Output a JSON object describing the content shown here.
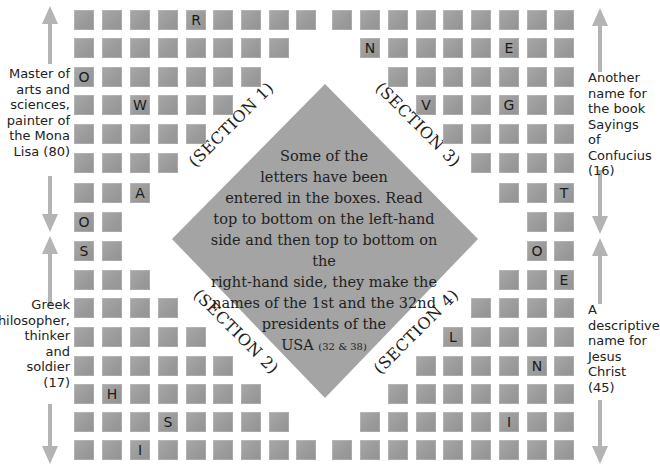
{
  "puzzle": {
    "instructions": {
      "lines": [
        "Some of the",
        "letters have been",
        "entered in the boxes. Read",
        "top to bottom on the left-hand",
        "side and then top to bottom on the",
        "right-hand side, they make the",
        "names of the 1st and the 32nd",
        "presidents of the"
      ],
      "last_line": "USA",
      "last_line_small": "(32 & 38)"
    },
    "sections": {
      "s1": "(SECTION 1)",
      "s2": "(SECTION 2)",
      "s3": "(SECTION 3)",
      "s4": "(SECTION 4)"
    },
    "clues": {
      "left_top": [
        "Master of",
        "arts and",
        "sciences,",
        "painter of",
        "the Mona",
        "Lisa (80)"
      ],
      "left_bottom": [
        "Greek",
        "philosopher,",
        "thinker",
        "and",
        "soldier",
        "(17)"
      ],
      "right_top": [
        "Another",
        "name for",
        "the book",
        "Sayings of",
        "Confucius",
        "(16)"
      ],
      "right_bottom": [
        "A",
        "descriptive",
        "name for",
        "Jesus",
        "Christ",
        "(45)"
      ]
    },
    "colors": {
      "box": "#9c9c9c",
      "diamond": "#a4a4a4",
      "arrow": "#b4b4b4",
      "text": "#222222"
    },
    "grid": {
      "left_cols_x": [
        74,
        102,
        130,
        158,
        186,
        213,
        241,
        269,
        296
      ],
      "right_cols_x": [
        332,
        360,
        388,
        416,
        443,
        471,
        499,
        527,
        554
      ],
      "rows_y": [
        10,
        38,
        67,
        95,
        124,
        153,
        183,
        212,
        241,
        270,
        298,
        327,
        356,
        384,
        412,
        440
      ],
      "left_rows": [
        {
          "cols": [
            0,
            1,
            2,
            3,
            4,
            5,
            6,
            7,
            8
          ],
          "letters": {
            "4": "R"
          }
        },
        {
          "cols": [
            0,
            1,
            2,
            3,
            4,
            5,
            6,
            7
          ],
          "letters": {}
        },
        {
          "cols": [
            0,
            1,
            2,
            3,
            4,
            5,
            6
          ],
          "letters": {
            "0": "O"
          }
        },
        {
          "cols": [
            0,
            1,
            2,
            3,
            4,
            5
          ],
          "letters": {
            "2": "W"
          }
        },
        {
          "cols": [
            0,
            1,
            2,
            3,
            4
          ],
          "letters": {}
        },
        {
          "cols": [
            0,
            1,
            2,
            3
          ],
          "letters": {}
        },
        {
          "cols": [
            0,
            1,
            2
          ],
          "letters": {
            "2": "A"
          }
        },
        {
          "cols": [
            0,
            1
          ],
          "letters": {
            "0": "O"
          }
        },
        {
          "cols": [
            0,
            1
          ],
          "letters": {
            "0": "S"
          }
        },
        {
          "cols": [
            0,
            1,
            2
          ],
          "letters": {}
        },
        {
          "cols": [
            0,
            1,
            2,
            3
          ],
          "letters": {}
        },
        {
          "cols": [
            0,
            1,
            2,
            3,
            4
          ],
          "letters": {}
        },
        {
          "cols": [
            0,
            1,
            2,
            3,
            4,
            5
          ],
          "letters": {}
        },
        {
          "cols": [
            0,
            1,
            2,
            3,
            4,
            5,
            6
          ],
          "letters": {
            "1": "H"
          }
        },
        {
          "cols": [
            0,
            1,
            2,
            3,
            4,
            5,
            6,
            7
          ],
          "letters": {
            "3": "S"
          }
        },
        {
          "cols": [
            0,
            1,
            2,
            3,
            4,
            5,
            6,
            7,
            8
          ],
          "letters": {
            "2": "I"
          }
        }
      ],
      "right_rows": [
        {
          "cols": [
            0,
            1,
            2,
            3,
            4,
            5,
            6,
            7,
            8
          ],
          "letters": {}
        },
        {
          "cols": [
            1,
            2,
            3,
            4,
            5,
            6,
            7,
            8
          ],
          "letters": {
            "1": "N",
            "6": "E"
          }
        },
        {
          "cols": [
            2,
            3,
            4,
            5,
            6,
            7,
            8
          ],
          "letters": {}
        },
        {
          "cols": [
            3,
            4,
            5,
            6,
            7,
            8
          ],
          "letters": {
            "3": "V",
            "6": "G"
          }
        },
        {
          "cols": [
            4,
            5,
            6,
            7,
            8
          ],
          "letters": {}
        },
        {
          "cols": [
            5,
            6,
            7,
            8
          ],
          "letters": {}
        },
        {
          "cols": [
            6,
            7,
            8
          ],
          "letters": {
            "8": "T"
          }
        },
        {
          "cols": [
            7,
            8
          ],
          "letters": {}
        },
        {
          "cols": [
            7,
            8
          ],
          "letters": {
            "7": "O"
          }
        },
        {
          "cols": [
            6,
            7,
            8
          ],
          "letters": {
            "8": "E"
          }
        },
        {
          "cols": [
            5,
            6,
            7,
            8
          ],
          "letters": {}
        },
        {
          "cols": [
            4,
            5,
            6,
            7,
            8
          ],
          "letters": {
            "4": "L"
          }
        },
        {
          "cols": [
            3,
            4,
            5,
            6,
            7,
            8
          ],
          "letters": {
            "7": "N"
          }
        },
        {
          "cols": [
            2,
            3,
            4,
            5,
            6,
            7,
            8
          ],
          "letters": {}
        },
        {
          "cols": [
            1,
            2,
            3,
            4,
            5,
            6,
            7,
            8
          ],
          "letters": {
            "6": "I"
          }
        },
        {
          "cols": [
            0,
            1,
            2,
            3,
            4,
            5,
            6,
            7,
            8
          ],
          "letters": {}
        }
      ]
    }
  }
}
